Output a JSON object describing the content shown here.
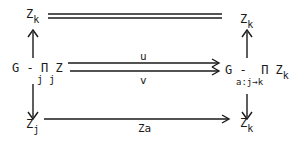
{
  "diagram": {
    "nodes": {
      "top_left": {
        "base": "Z",
        "sub": "k"
      },
      "top_right": {
        "base": "Z",
        "sub": "k"
      },
      "mid_left": {
        "prefix": "G - ",
        "prod": "Π",
        "base": "Z",
        "prod_sub": "j",
        "sub": "j"
      },
      "mid_right": {
        "prefix": "G - ",
        "prod": "Π",
        "base": "Z",
        "prod_sub": "a:j→k",
        "sub": "k"
      },
      "bottom_left": {
        "base": "Z",
        "sub": "j"
      },
      "bottom_right": {
        "base": "Z",
        "sub": "k"
      }
    },
    "arrows": {
      "top": {
        "type": "double-line (equality)",
        "label": ""
      },
      "mid_upper": {
        "label": "u"
      },
      "mid_lower": {
        "label": "v"
      },
      "bottom": {
        "label": "Za"
      },
      "left_up": {
        "label": ""
      },
      "left_down": {
        "label": ""
      },
      "right_up": {
        "label": ""
      },
      "right_down": {
        "label": ""
      }
    }
  }
}
